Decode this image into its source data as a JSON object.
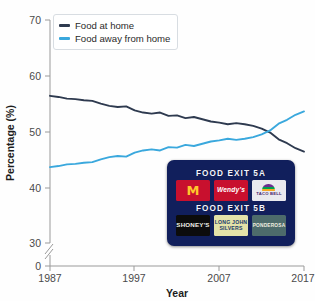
{
  "chart_data": {
    "type": "line",
    "title": "",
    "xlabel": "Year",
    "ylabel": "Percentage (%)",
    "xlim": [
      1987,
      2017
    ],
    "ylim": [
      30,
      70
    ],
    "y_axis_break": true,
    "y_break_from": 0,
    "y_break_to": 30,
    "grid": false,
    "legend_position": "top-left",
    "xticks": [
      "1987",
      "1997",
      "2007",
      "2017"
    ],
    "yticks": [
      "0",
      "30",
      "40",
      "50",
      "60",
      "70"
    ],
    "x": [
      1987,
      1988,
      1989,
      1990,
      1991,
      1992,
      1993,
      1994,
      1995,
      1996,
      1997,
      1998,
      1999,
      2000,
      2001,
      2002,
      2003,
      2004,
      2005,
      2006,
      2007,
      2008,
      2009,
      2010,
      2011,
      2012,
      2013,
      2014,
      2015,
      2016,
      2017
    ],
    "series": [
      {
        "name": "Food at home",
        "color": "#2e3a4f",
        "values": [
          56.4,
          56.2,
          55.9,
          55.8,
          55.6,
          55.5,
          55.0,
          54.6,
          54.4,
          54.5,
          53.8,
          53.4,
          53.2,
          53.4,
          52.8,
          52.9,
          52.4,
          52.6,
          52.2,
          51.8,
          51.6,
          51.3,
          51.5,
          51.3,
          51.0,
          50.5,
          49.8,
          48.6,
          47.9,
          47.0,
          46.4
        ]
      },
      {
        "name": "Food away from home",
        "color": "#3aa8dd",
        "values": [
          43.6,
          43.8,
          44.1,
          44.2,
          44.4,
          44.5,
          45.0,
          45.4,
          45.6,
          45.5,
          46.2,
          46.6,
          46.8,
          46.6,
          47.2,
          47.1,
          47.6,
          47.4,
          47.8,
          48.2,
          48.4,
          48.7,
          48.5,
          48.7,
          49.0,
          49.5,
          50.2,
          51.4,
          52.1,
          53.0,
          53.6
        ]
      }
    ]
  },
  "legend": {
    "items": [
      {
        "label": "Food at home",
        "color": "#2e3a4f"
      },
      {
        "label": "Food away from home",
        "color": "#3aa8dd"
      }
    ]
  },
  "inset_sign": {
    "heading_a": "FOOD EXIT 5A",
    "heading_b": "FOOD EXIT 5B",
    "row_a": [
      {
        "name": "McDonald's",
        "glyph": "M"
      },
      {
        "name": "Wendy's",
        "glyph": "Wendy's"
      },
      {
        "name": "Taco Bell",
        "glyph": "TACO BELL"
      }
    ],
    "row_b": [
      {
        "name": "Shoney's",
        "glyph": "SHONEY'S"
      },
      {
        "name": "Long John Silver's",
        "glyph": "LONG JOHN SILVERS"
      },
      {
        "name": "Ponderosa",
        "glyph": "PONDEROSA"
      }
    ]
  }
}
